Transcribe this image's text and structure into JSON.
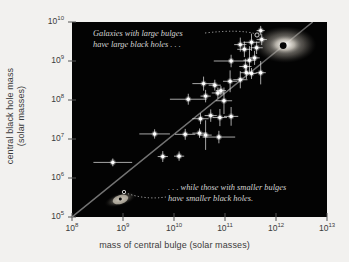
{
  "figure": {
    "background_color": "#f2f1ef",
    "plot_background_color": "#030303",
    "point_color": "#ffffff",
    "line_color": "#9a9a9a",
    "annotation_color": "#d8d8d8"
  },
  "axes": {
    "x": {
      "title": "mass of central bulge (solar masses)",
      "ticks": [
        "10^8",
        "10^9",
        "10^10",
        "10^11",
        "10^12",
        "10^13"
      ],
      "tick_bases": [
        "10",
        "10",
        "10",
        "10",
        "10",
        "10"
      ],
      "tick_exponents": [
        "8",
        "9",
        "10",
        "11",
        "12",
        "13"
      ],
      "min_exponent": 8,
      "max_exponent": 13,
      "scale": "log"
    },
    "y": {
      "title_line1": "central black hole mass",
      "title_line2": "(solar masses)",
      "ticks": [
        "10^5",
        "10^6",
        "10^7",
        "10^8",
        "10^9",
        "10^10"
      ],
      "tick_bases": [
        "10",
        "10",
        "10",
        "10",
        "10",
        "10"
      ],
      "tick_exponents": [
        "5",
        "6",
        "7",
        "8",
        "9",
        "10"
      ],
      "min_exponent": 5,
      "max_exponent": 10,
      "scale": "log"
    }
  },
  "annotations": [
    {
      "id": "large-bulges",
      "line1": "Galaxies with large bulges",
      "line2": "have large black holes . . .",
      "position": "top-left-of-plot"
    },
    {
      "id": "small-bulges",
      "line1": ". . . while those with smaller bulges",
      "line2": "have smaller black holes.",
      "position": "bottom-right-of-plot"
    }
  ],
  "illustrations": [
    {
      "name": "elliptical-galaxy-glow",
      "description": "large diffuse elliptical galaxy with dark central black hole",
      "x_exponent": 12.18,
      "y_exponent": 9.42
    },
    {
      "name": "spiral-galaxy-edge-on",
      "description": "small edge-on spiral galaxy with tiny black hole",
      "x_exponent": 8.95,
      "y_exponent": 5.45
    }
  ],
  "chart_data": {
    "type": "scatter",
    "title": "",
    "xlabel": "mass of central bulge (solar masses)",
    "ylabel": "central black hole mass (solar masses)",
    "xscale": "log",
    "yscale": "log",
    "xlim": [
      100000000.0,
      10000000000000.0
    ],
    "ylim": [
      100000.0,
      10000000000.0
    ],
    "grid": false,
    "legend": "none",
    "x_is_log10": true,
    "y_is_log10": true,
    "fit_line": {
      "label": "best-fit relation",
      "x_start_exponent": 8.0,
      "y_start_exponent": 5.0,
      "x_end_exponent": 12.72,
      "y_end_exponent": 10.0,
      "color": "#9a9a9a"
    },
    "points": [
      {
        "x": 8.8,
        "y": 6.4,
        "xerr": [
          0.38,
          0.38
        ],
        "yerr": [
          0.1,
          0.1
        ]
      },
      {
        "x": 9.78,
        "y": 6.55,
        "xerr": [
          0.1,
          0.1
        ],
        "yerr": [
          0.14,
          0.14
        ]
      },
      {
        "x": 10.1,
        "y": 6.56,
        "xerr": [
          0.1,
          0.1
        ],
        "yerr": [
          0.12,
          0.12
        ]
      },
      {
        "x": 9.62,
        "y": 7.13,
        "xerr": [
          0.3,
          0.3
        ],
        "yerr": [
          0.12,
          0.12
        ]
      },
      {
        "x": 10.22,
        "y": 7.12,
        "xerr": [
          0.2,
          0.2
        ],
        "yerr": [
          0.14,
          0.14
        ]
      },
      {
        "x": 10.5,
        "y": 7.15,
        "xerr": [
          0.14,
          0.14
        ],
        "yerr": [
          0.12,
          0.12
        ]
      },
      {
        "x": 10.62,
        "y": 7.1,
        "xerr": [
          0.12,
          0.12
        ],
        "yerr": [
          0.38,
          0.38
        ]
      },
      {
        "x": 10.88,
        "y": 7.05,
        "xerr": [
          0.32,
          0.32
        ],
        "yerr": [
          0.16,
          0.16
        ]
      },
      {
        "x": 10.52,
        "y": 7.52,
        "xerr": [
          0.16,
          0.16
        ],
        "yerr": [
          0.14,
          0.14
        ]
      },
      {
        "x": 10.72,
        "y": 7.6,
        "xerr": [
          0.12,
          0.12
        ],
        "yerr": [
          0.16,
          0.16
        ]
      },
      {
        "x": 10.9,
        "y": 7.55,
        "xerr": [
          0.14,
          0.14
        ],
        "yerr": [
          0.22,
          0.22
        ]
      },
      {
        "x": 11.12,
        "y": 7.58,
        "xerr": [
          0.14,
          0.14
        ],
        "yerr": [
          0.24,
          0.24
        ]
      },
      {
        "x": 10.28,
        "y": 8.02,
        "xerr": [
          0.36,
          0.36
        ],
        "yerr": [
          0.14,
          0.14
        ]
      },
      {
        "x": 10.62,
        "y": 8.1,
        "xerr": [
          0.1,
          0.1
        ],
        "yerr": [
          0.16,
          0.16
        ]
      },
      {
        "x": 10.98,
        "y": 7.98,
        "xerr": [
          0.16,
          0.16
        ],
        "yerr": [
          0.34,
          0.34
        ]
      },
      {
        "x": 10.86,
        "y": 8.18,
        "xerr": [
          0.12,
          0.12
        ],
        "yerr": [
          0.14,
          0.14
        ]
      },
      {
        "x": 10.92,
        "y": 8.24,
        "xerr": [
          0.1,
          0.1
        ],
        "yerr": [
          0.12,
          0.12
        ]
      },
      {
        "x": 10.58,
        "y": 8.42,
        "xerr": [
          0.22,
          0.22
        ],
        "yerr": [
          0.18,
          0.18
        ]
      },
      {
        "x": 10.8,
        "y": 8.38,
        "xerr": [
          0.12,
          0.12
        ],
        "yerr": [
          0.14,
          0.14
        ]
      },
      {
        "x": 11.1,
        "y": 8.48,
        "xerr": [
          0.14,
          0.14
        ],
        "yerr": [
          0.28,
          0.28
        ]
      },
      {
        "x": 11.3,
        "y": 8.52,
        "xerr": [
          0.14,
          0.14
        ],
        "yerr": [
          0.22,
          0.22
        ]
      },
      {
        "x": 11.42,
        "y": 8.7,
        "xerr": [
          0.12,
          0.12
        ],
        "yerr": [
          0.16,
          0.16
        ]
      },
      {
        "x": 11.52,
        "y": 8.68,
        "xerr": [
          0.1,
          0.1
        ],
        "yerr": [
          0.14,
          0.14
        ]
      },
      {
        "x": 11.7,
        "y": 8.7,
        "xerr": [
          0.1,
          0.1
        ],
        "yerr": [
          0.3,
          0.3
        ]
      },
      {
        "x": 11.4,
        "y": 8.86,
        "xerr": [
          0.12,
          0.12
        ],
        "yerr": [
          0.2,
          0.2
        ]
      },
      {
        "x": 11.12,
        "y": 9.0,
        "xerr": [
          0.34,
          0.34
        ],
        "yerr": [
          0.16,
          0.16
        ]
      },
      {
        "x": 11.48,
        "y": 9.02,
        "xerr": [
          0.12,
          0.12
        ],
        "yerr": [
          0.36,
          0.36
        ]
      },
      {
        "x": 11.58,
        "y": 9.08,
        "xerr": [
          0.1,
          0.1
        ],
        "yerr": [
          0.18,
          0.18
        ]
      },
      {
        "x": 11.38,
        "y": 9.3,
        "xerr": [
          0.14,
          0.14
        ],
        "yerr": [
          0.2,
          0.2
        ]
      },
      {
        "x": 11.62,
        "y": 9.34,
        "xerr": [
          0.12,
          0.12
        ],
        "yerr": [
          0.16,
          0.16
        ]
      },
      {
        "x": 11.52,
        "y": 9.48,
        "xerr": [
          0.16,
          0.16
        ],
        "yerr": [
          0.22,
          0.22
        ]
      },
      {
        "x": 11.3,
        "y": 9.42,
        "xerr": [
          0.12,
          0.12
        ],
        "yerr": [
          0.18,
          0.18
        ]
      },
      {
        "x": 11.72,
        "y": 9.55,
        "xerr": [
          0.1,
          0.1
        ],
        "yerr": [
          0.14,
          0.14
        ]
      },
      {
        "x": 11.7,
        "y": 9.78,
        "xerr": [
          0.08,
          0.08
        ],
        "yerr": [
          0.12,
          0.12
        ]
      }
    ]
  }
}
